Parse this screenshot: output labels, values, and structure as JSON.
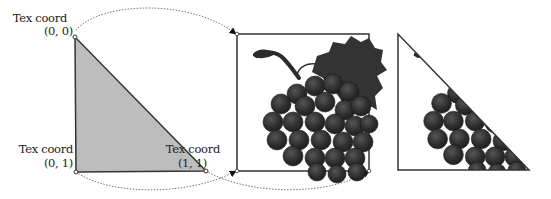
{
  "figure": {
    "colors": {
      "triangle_fill": "#bdbdbd",
      "stroke": "#333333",
      "grape": "#2b2b2b",
      "leaf": "#333333",
      "arc": "#777777"
    },
    "source_triangle": {
      "vertices": [
        {
          "name": "top-left",
          "label_line1": "Tex coord",
          "label_line2": "(0, 0)"
        },
        {
          "name": "bottom-left",
          "label_line1": "Tex coord",
          "label_line2": "(0, 1)"
        },
        {
          "name": "bottom-right",
          "label_line1": "Tex coord",
          "label_line2": "(1, 1)"
        }
      ]
    },
    "texture_image": {
      "subject": "grape-cluster"
    },
    "result": {
      "subject": "texture-mapped-triangle"
    }
  }
}
